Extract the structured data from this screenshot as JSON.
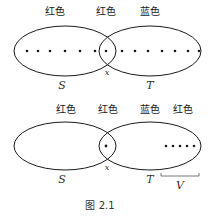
{
  "top": {
    "labels": [
      "红色",
      "红色",
      "蓝色"
    ],
    "set_s": "S",
    "set_t": "T",
    "point": "x"
  },
  "bottom": {
    "labels": [
      "红色",
      "红色",
      "蓝色",
      "红色"
    ],
    "set_s": "S",
    "set_t": "T",
    "point": "x",
    "subset": "V"
  },
  "caption": "图 2.1"
}
